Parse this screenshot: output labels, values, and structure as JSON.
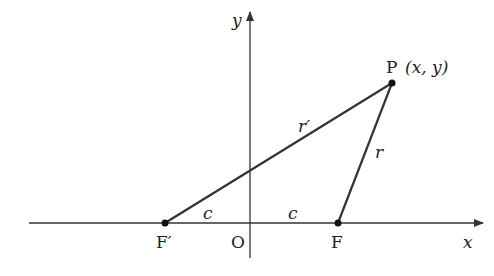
{
  "diagram": {
    "axes": {
      "x_label": "x",
      "y_label": "y",
      "origin_label": "O"
    },
    "points": {
      "P": {
        "label": "P",
        "coords_label": "(x, y)"
      },
      "F": {
        "label": "F"
      },
      "F_prime": {
        "label": "F′"
      }
    },
    "segments": {
      "r_prime": "r′",
      "r": "r",
      "c_left": "c",
      "c_right": "c"
    },
    "colors": {
      "line": "#333333",
      "axis": "#333333",
      "background": "#ffffff"
    }
  }
}
